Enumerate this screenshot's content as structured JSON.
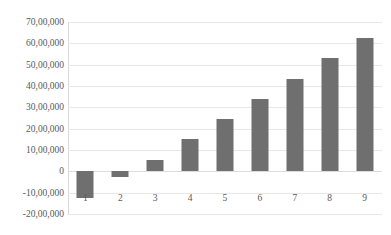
{
  "chart_data": {
    "type": "bar",
    "title": "",
    "subtitle": "",
    "xlabel": "",
    "ylabel": "",
    "categories": [
      "1",
      "2",
      "3",
      "4",
      "5",
      "6",
      "7",
      "8",
      "9"
    ],
    "values": [
      -1250000,
      -250000,
      550000,
      1530000,
      2470000,
      3400000,
      4350000,
      5290000,
      6250000
    ],
    "series": [
      {
        "name": "",
        "values": [
          -1250000,
          -250000,
          550000,
          1530000,
          2470000,
          3400000,
          4350000,
          5290000,
          6250000
        ]
      }
    ],
    "ylim": [
      -2000000,
      7000000
    ],
    "ytick_values": [
      7000000,
      6000000,
      5000000,
      4000000,
      3000000,
      2000000,
      1000000,
      0,
      -1000000,
      -2000000
    ],
    "ytick_labels": [
      "70,00,000",
      "60,00,000",
      "50,00,000",
      "40,00,000",
      "30,00,000",
      "20,00,000",
      "10,00,000",
      "0",
      "-10,00,000",
      "-20,00,000"
    ],
    "grid": true,
    "grid_axis": "y",
    "legend": false,
    "legend_position": "none",
    "bar_color": "#6f6f6f",
    "gridline_color": "#e8e8e8",
    "axis_text_color": "#595959",
    "background_color": "#ffffff",
    "number_format": "indian"
  }
}
